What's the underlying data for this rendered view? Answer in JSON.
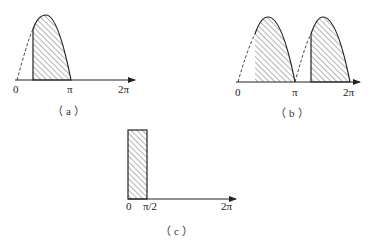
{
  "figures": {
    "a": {
      "caption": "（a）",
      "ticks": [
        "0",
        "π",
        "2π"
      ],
      "description": "Half-wave sine, conduction from firing angle to π shaded"
    },
    "b": {
      "caption": "（b）",
      "ticks": [
        "0",
        "π",
        "2π"
      ],
      "description": "Full-wave sine, conduction from firing angle to π and from π+α to 2π shaded"
    },
    "c": {
      "caption": "（c）",
      "ticks": [
        "0",
        "π/2",
        "2π"
      ],
      "description": "Rectangular pulse from 0 to π/2 shaded"
    }
  },
  "colors": {
    "stroke": "#222222",
    "hatch": "#444444",
    "background": "#ffffff"
  }
}
